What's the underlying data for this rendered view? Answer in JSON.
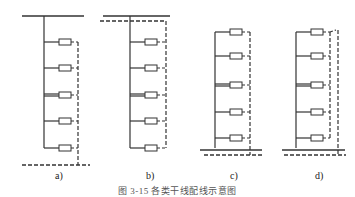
{
  "figure": {
    "caption": "图 3-15 各类干线配线示意图",
    "panels": [
      {
        "id": "a",
        "label": "a)"
      },
      {
        "id": "b",
        "label": "b)"
      },
      {
        "id": "c",
        "label": "c)"
      },
      {
        "id": "d",
        "label": "d)"
      }
    ],
    "colors": {
      "line": "#333333",
      "background": "#ffffff"
    }
  }
}
